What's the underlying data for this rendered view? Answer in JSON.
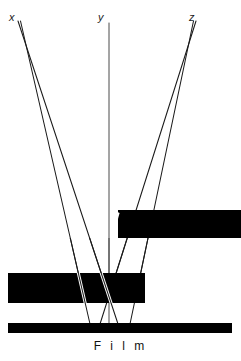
{
  "figure": {
    "title": "",
    "type": "ray-optics-diagram",
    "width": 241,
    "height": 361,
    "background_color": "#ffffff",
    "ink_color": "#000000",
    "line_color": "#1a1a1a"
  },
  "labels": {
    "axis_x": "x",
    "axis_y": "y",
    "axis_z": "z",
    "film": "F i l m"
  },
  "sources": [
    {
      "id": "x",
      "label": "x",
      "x": 18,
      "y": 21
    },
    {
      "id": "y",
      "label": "y",
      "x": 107,
      "y": 23
    },
    {
      "id": "z",
      "label": "z",
      "x": 196,
      "y": 21
    }
  ],
  "slit_assembly": {
    "upper_block": {
      "name": "upper-right-absorber-bar",
      "x": 118,
      "y": 210,
      "width": 123,
      "height": 28,
      "fill": "#000000"
    },
    "lower_left_block": {
      "name": "lower-left-absorber-bar",
      "x": 8,
      "y": 273,
      "width": 137,
      "height": 30,
      "fill": "#000000"
    },
    "aperture": {
      "name": "slit-aperture",
      "center_x": 117,
      "center_y": 222,
      "width": 7,
      "height": 20
    }
  },
  "film": {
    "name": "film-strip",
    "x": 8,
    "y": 323,
    "width": 224,
    "height": 10,
    "fill": "#000000"
  },
  "rays": {
    "beam_x": {
      "label": "x",
      "description": "two converging rays from source x",
      "segments": [
        {
          "x1": 18,
          "y1": 21,
          "x2": 118,
          "y2": 324
        },
        {
          "x1": 20,
          "y1": 21,
          "x2": 90,
          "y2": 324
        }
      ]
    },
    "beam_y": {
      "label": "y",
      "description": "central vertical ray from source y",
      "segments": [
        {
          "x1": 109,
          "y1": 23,
          "x2": 109,
          "y2": 324
        }
      ]
    },
    "beam_z": {
      "label": "z",
      "description": "two converging rays from source z",
      "segments": [
        {
          "x1": 196,
          "y1": 21,
          "x2": 100,
          "y2": 324
        },
        {
          "x1": 198,
          "y1": 21,
          "x2": 130,
          "y2": 324
        }
      ]
    }
  },
  "geometry_notes": {
    "crossing_region_y": 225,
    "ray_count": 5
  }
}
